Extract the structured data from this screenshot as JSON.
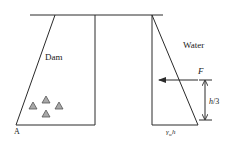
{
  "figure": {
    "type": "dam-water-pressure-diagram",
    "labels": {
      "dam": "Dam",
      "water": "Water",
      "force": "F",
      "height_fraction": "h/3",
      "pressure_base": "γwh",
      "pressure_base_gamma": "γ",
      "pressure_base_sub": "w",
      "pressure_base_h": "h",
      "toe_point": "A"
    },
    "colors": {
      "line": "#2a2a2a",
      "aggregate_fill": "#a8a8a8",
      "aggregate_stroke": "#555555",
      "background": "#ffffff"
    },
    "elements": {
      "water_surface_line": {
        "x1": 30,
        "y1": 15,
        "x2": 163,
        "y2": 15
      },
      "dam_section": {
        "points": [
          [
            55,
            15
          ],
          [
            95,
            15
          ],
          [
            95,
            125
          ],
          [
            16,
            125
          ]
        ]
      },
      "pressure_triangle": {
        "points": [
          [
            152,
            15
          ],
          [
            198,
            125
          ],
          [
            152,
            125
          ]
        ]
      },
      "force_arrow": {
        "from": [
          198,
          80
        ],
        "to": [
          158,
          80
        ],
        "direction": "left"
      },
      "dimension_arrow": {
        "x": 205,
        "y_top": 80,
        "y_bottom": 120
      },
      "aggregates": [
        [
          33,
          105
        ],
        [
          46,
          99
        ],
        [
          59,
          105
        ],
        [
          46,
          113
        ]
      ]
    }
  }
}
